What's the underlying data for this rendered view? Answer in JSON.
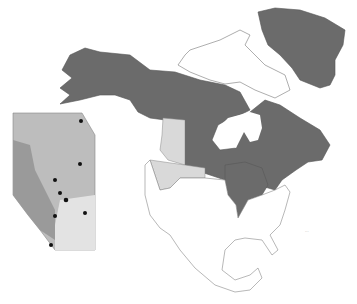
{
  "map": {
    "title": "North America range map with Alberta inset",
    "colors": {
      "range_dark": "#6b6b6b",
      "range_light": "#d9d9d9",
      "outline": "#888888",
      "background": "#ffffff",
      "inset_fill": "#bdbdbd",
      "inset_dark": "#9a9a9a",
      "inset_light": "#e3e3e3",
      "sites": "#111111"
    },
    "regions": {
      "dark": [
        "Alaska",
        "Yukon",
        "Northwest Territories",
        "Nunavut (mainland)",
        "Saskatchewan",
        "Manitoba",
        "Ontario",
        "Quebec",
        "Newfoundland and Labrador",
        "New Brunswick",
        "Nova Scotia",
        "Greenland",
        "Minnesota",
        "Wisconsin",
        "Michigan",
        "Illinois"
      ],
      "light": [
        "British Columbia (east)",
        "Alberta",
        "Montana",
        "Idaho",
        "Wyoming (north)"
      ],
      "white": [
        "Arctic islands",
        "Remaining United States",
        "Mexico"
      ]
    },
    "inset": {
      "name": "Alberta",
      "site_count": 10
    },
    "scale_label": "..."
  }
}
